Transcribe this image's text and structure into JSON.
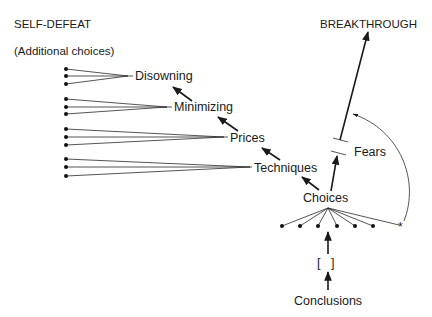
{
  "titles": {
    "left": "SELF-DEFEAT",
    "left_sub": "(Additional choices)",
    "right": "BREAKTHROUGH"
  },
  "fan_groups": [
    {
      "label": "Disowning",
      "dots_x": 66,
      "dots_y": [
        69,
        76,
        84
      ],
      "apex": [
        128,
        76
      ],
      "label_pos": [
        135,
        80
      ]
    },
    {
      "label": "Minimizing",
      "dots_x": 66,
      "dots_y": [
        99,
        107,
        114
      ],
      "apex": [
        167,
        107
      ],
      "label_pos": [
        174,
        111
      ]
    },
    {
      "label": "Prices",
      "dots_x": 66,
      "dots_y": [
        129,
        137,
        145
      ],
      "apex": [
        224,
        137
      ],
      "label_pos": [
        230,
        142
      ]
    },
    {
      "label": "Techniques",
      "dots_x": 66,
      "dots_y": [
        159,
        167,
        176
      ],
      "apex": [
        250,
        167
      ],
      "label_pos": [
        254,
        172
      ]
    }
  ],
  "chain_arrows": [
    {
      "from": [
        319,
        190
      ],
      "to": [
        302,
        177
      ]
    },
    {
      "from": [
        280,
        160
      ],
      "to": [
        262,
        148
      ]
    },
    {
      "from": [
        238,
        131
      ],
      "to": [
        218,
        117
      ]
    },
    {
      "from": [
        192,
        101
      ],
      "to": [
        173,
        87
      ]
    }
  ],
  "choices": {
    "label": "Choices",
    "label_pos": [
      303,
      202
    ],
    "apex": [
      328,
      208
    ],
    "bottom_dots_y": 226,
    "bottom_dots_x": [
      282,
      300,
      318,
      337,
      355,
      373
    ],
    "asterisk": {
      "x": 401,
      "y": 226,
      "glyph": "*"
    }
  },
  "fears": {
    "label": "Fears",
    "label_pos": [
      354,
      156
    ],
    "bar_top": {
      "x1": 333,
      "y1": 138,
      "x2": 348,
      "y2": 142
    },
    "bar_bottom": {
      "x1": 331,
      "y1": 151,
      "x2": 346,
      "y2": 155
    },
    "arrow_choices_to_fears": {
      "from": [
        331,
        191
      ],
      "to": [
        337,
        156
      ]
    },
    "arrow_fears_to_breakthrough": {
      "from": [
        340,
        140
      ],
      "to": [
        368,
        32
      ]
    }
  },
  "curved_arrow": {
    "path": "M 404 221 C 420 180, 400 130, 353 114"
  },
  "conclusions": {
    "label": "Conclusions",
    "label_pos": [
      294,
      305
    ],
    "bracket": "[   ]",
    "bracket_pos": [
      317,
      267
    ],
    "arrow_to_bracket": {
      "from": [
        328,
        290
      ],
      "to": [
        328,
        272
      ]
    },
    "arrow_to_dots": {
      "from": [
        328,
        254
      ],
      "to": [
        328,
        232
      ]
    }
  },
  "colors": {
    "ink": "#1a1a1a",
    "background": "#ffffff"
  }
}
